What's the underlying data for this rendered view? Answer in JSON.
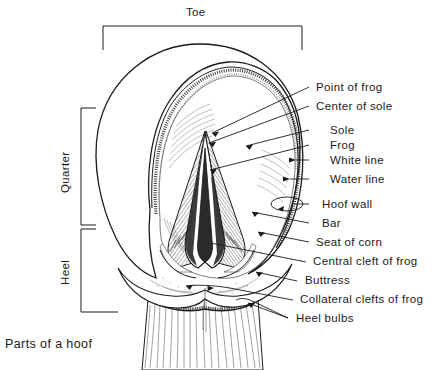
{
  "figure": {
    "caption": "Parts of a hoof",
    "background_color": "#ffffff",
    "ink_color": "#1a1a1a",
    "width": 441,
    "height": 370
  },
  "region_brackets": [
    {
      "id": "toe",
      "label": "Toe",
      "orientation": "horizontal-top"
    },
    {
      "id": "quarter",
      "label": "Quarter",
      "orientation": "vertical-left"
    },
    {
      "id": "heel",
      "label": "Heel",
      "orientation": "vertical-left"
    }
  ],
  "callouts": [
    {
      "id": "point-of-frog",
      "label": "Point of frog"
    },
    {
      "id": "center-of-sole",
      "label": "Center of sole"
    },
    {
      "id": "sole",
      "label": "Sole"
    },
    {
      "id": "frog",
      "label": "Frog"
    },
    {
      "id": "white-line",
      "label": "White line"
    },
    {
      "id": "water-line",
      "label": "Water line"
    },
    {
      "id": "hoof-wall",
      "label": "Hoof wall"
    },
    {
      "id": "bar",
      "label": "Bar"
    },
    {
      "id": "seat-of-corn",
      "label": "Seat of corn"
    },
    {
      "id": "central-cleft-of-frog",
      "label": "Central cleft of frog"
    },
    {
      "id": "buttress",
      "label": "Buttress"
    },
    {
      "id": "collateral-clefts-of-frog",
      "label": "Collateral clefts of frog"
    },
    {
      "id": "heel-bulbs",
      "label": "Heel bulbs"
    }
  ]
}
